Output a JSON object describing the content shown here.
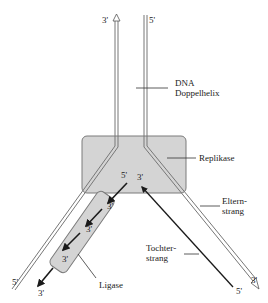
{
  "diagram": {
    "type": "dna-replication-fork",
    "labels": {
      "dna_doppelhelix_line1": "DNA",
      "dna_doppelhelix_line2": "Doppelhelix",
      "replikase": "Replikase",
      "elternstrang_line1": "Eltern-",
      "elternstrang_line2": "strang",
      "tochterstrang_line1": "Tochter-",
      "tochterstrang_line2": "strang",
      "ligase": "Ligase"
    },
    "ends": {
      "top_left": "3'",
      "top_right": "5'",
      "fork_left_inner": "5'",
      "fork_right_inner": "3'",
      "bottom_left_parent": "5'",
      "bottom_left_daughter": "3'",
      "bottom_right_daughter": "5'",
      "bottom_right_parent": "3'",
      "okazaki_1": "3'",
      "okazaki_2": "3'",
      "okazaki_3": "3'"
    },
    "colors": {
      "enzyme_fill": "#d4d4d4",
      "enzyme_stroke": "#7a7a7a",
      "strand": "#777777",
      "daughter": "#1a1a1a"
    }
  }
}
